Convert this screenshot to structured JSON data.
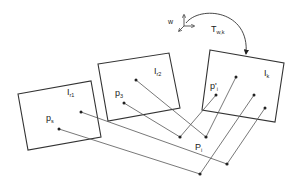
{
  "diagram": {
    "type": "multi-view projection diagram",
    "frames": [
      {
        "id": "I_r1",
        "label": "I",
        "subscript": "r1",
        "corners": [
          [
            18,
            94
          ],
          [
            91,
            81
          ],
          [
            101,
            137
          ],
          [
            28,
            150
          ]
        ]
      },
      {
        "id": "I_r2",
        "label": "I",
        "subscript": "r2",
        "corners": [
          [
            98,
            64
          ],
          [
            169,
            53
          ],
          [
            180,
            108
          ],
          [
            108,
            121
          ]
        ]
      },
      {
        "id": "I_k",
        "label": "I",
        "subscript": "k",
        "corners": [
          [
            210,
            50
          ],
          [
            284,
            63
          ],
          [
            275,
            122
          ],
          [
            202,
            110
          ]
        ]
      }
    ],
    "labels": {
      "i_r1": {
        "main": "I",
        "sub": "r1"
      },
      "i_r2": {
        "main": "I",
        "sub": "r2"
      },
      "i_k": {
        "main": "I",
        "sub": "k"
      },
      "p_s": {
        "main": "p",
        "sub": "s"
      },
      "p_3": {
        "main": "p",
        "sub": "3"
      },
      "p_prime_i": {
        "main": "p'",
        "sub": "i"
      },
      "P_i": {
        "main": "P",
        "sub": "i"
      },
      "world": "w",
      "transform": {
        "main": "T",
        "sub": "w,k"
      }
    },
    "image_points": [
      {
        "frame": "I_r1",
        "xy": [
          81,
          112
        ]
      },
      {
        "frame": "I_r1",
        "xy": [
          59,
          129
        ],
        "label": "p_s"
      },
      {
        "frame": "I_r2",
        "xy": [
          136,
          80
        ]
      },
      {
        "frame": "I_r2",
        "xy": [
          124,
          103
        ],
        "label": "p_3"
      },
      {
        "frame": "I_k",
        "xy": [
          236,
          77
        ],
        "label": "p'_i"
      },
      {
        "frame": "I_k",
        "xy": [
          216,
          95
        ]
      },
      {
        "frame": "I_k",
        "xy": [
          254,
          95
        ]
      },
      {
        "frame": "I_k",
        "xy": [
          265,
          108
        ]
      }
    ],
    "world_points": [
      {
        "xy": [
          180,
          137
        ]
      },
      {
        "xy": [
          206,
          137
        ]
      },
      {
        "xy": [
          227,
          164
        ]
      },
      {
        "xy": [
          200,
          174
        ],
        "label": "P_i"
      }
    ],
    "rays": [
      {
        "from": [
          81,
          112
        ],
        "to": [
          227,
          164
        ]
      },
      {
        "from": [
          59,
          129
        ],
        "to": [
          200,
          174
        ]
      },
      {
        "from": [
          136,
          80
        ],
        "to": [
          206,
          137
        ]
      },
      {
        "from": [
          124,
          103
        ],
        "to": [
          180,
          137
        ]
      },
      {
        "from": [
          180,
          137
        ],
        "to": [
          216,
          95
        ]
      },
      {
        "from": [
          206,
          137
        ],
        "to": [
          236,
          77
        ]
      },
      {
        "from": [
          200,
          174
        ],
        "to": [
          254,
          95
        ]
      },
      {
        "from": [
          227,
          164
        ],
        "to": [
          265,
          108
        ]
      }
    ],
    "colors": {
      "stroke": "#333333",
      "ray": "#555555",
      "background": "#ffffff"
    }
  }
}
